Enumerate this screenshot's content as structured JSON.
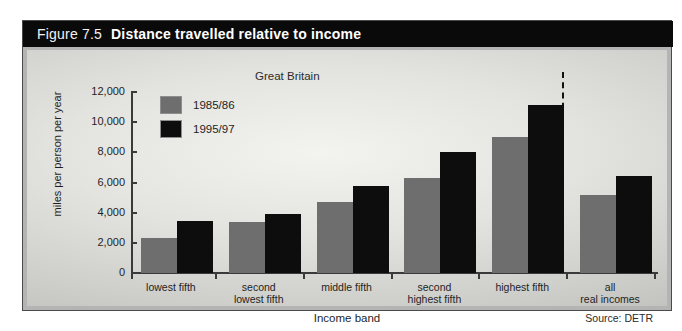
{
  "figure": {
    "number": "Figure 7.5",
    "title": "Distance travelled relative to income"
  },
  "source": "Source: DETR",
  "colors": {
    "series_1985_86": "#6e6e6e",
    "series_1995_97": "#0d0d0d",
    "titlebar_bg": "#0a0a0a",
    "titlebar_text": "#ffffff",
    "frame_border": "#4a4a4a",
    "axis": "#3a3a3a"
  },
  "chart_data": {
    "type": "bar",
    "title": "Distance travelled relative to income",
    "subtitle": "Great Britain",
    "xlabel": "Income band",
    "ylabel": "miles per person per year",
    "categories": [
      "lowest fifth",
      "second lowest fifth",
      "middle fifth",
      "second highest fifth",
      "highest fifth",
      "all real incomes"
    ],
    "series": [
      {
        "name": "1985/86",
        "values": [
          2300,
          3350,
          4700,
          6300,
          9000,
          5200
        ]
      },
      {
        "name": "1995/97",
        "values": [
          3450,
          3900,
          5750,
          8000,
          11150,
          6450
        ]
      }
    ],
    "ylim": [
      0,
      12000
    ],
    "yticks": [
      0,
      2000,
      4000,
      6000,
      8000,
      10000,
      12000
    ],
    "ytick_labels": [
      "0",
      "2,000",
      "4,000",
      "6,000",
      "8,000",
      "10,000",
      "12,000"
    ],
    "grid": false,
    "legend_position": "top-left",
    "annotations": [
      {
        "type": "dashed-vertical-separator",
        "after_category": "highest fifth"
      }
    ]
  }
}
